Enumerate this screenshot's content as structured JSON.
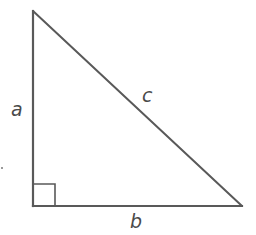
{
  "diagram": {
    "type": "right-triangle",
    "colors": {
      "stroke": "#595959",
      "label": "#4a4a4a",
      "background": "#ffffff"
    },
    "vertices": {
      "top": [
        33,
        11
      ],
      "right_angle": [
        33,
        206
      ],
      "right": [
        242,
        206
      ]
    },
    "right_angle_marker": {
      "size": 22
    },
    "labels": {
      "a": "a",
      "b": "b",
      "c": "c"
    }
  }
}
